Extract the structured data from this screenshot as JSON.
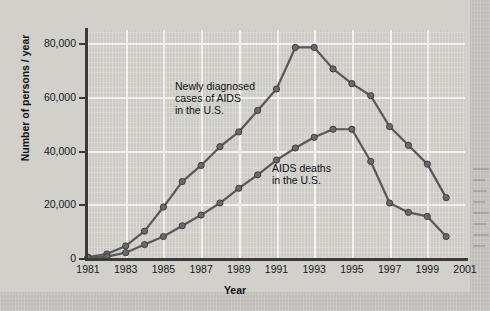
{
  "chart_data": {
    "type": "line",
    "title": "",
    "xlabel": "Year",
    "ylabel": "Number of persons / year",
    "grid": true,
    "legend_position": "inline-annotations",
    "xlim": [
      1981,
      2001
    ],
    "ylim": [
      0,
      85000
    ],
    "x": [
      1981,
      1982,
      1983,
      1984,
      1985,
      1986,
      1987,
      1988,
      1989,
      1990,
      1991,
      1992,
      1993,
      1994,
      1995,
      1996,
      1997,
      1998,
      1999,
      2000
    ],
    "x_tick_labels": [
      "1981",
      "1983",
      "1985",
      "1987",
      "1989",
      "1991",
      "1993",
      "1995",
      "1997",
      "1999",
      "2001"
    ],
    "x_tick_values": [
      1981,
      1983,
      1985,
      1987,
      1989,
      1991,
      1993,
      1995,
      1997,
      1999,
      2001
    ],
    "y_tick_labels": [
      "0",
      "20,000",
      "40,000",
      "60,000",
      "80,000"
    ],
    "y_tick_values": [
      0,
      20000,
      40000,
      60000,
      80000
    ],
    "series": [
      {
        "name": "Newly diagnosed cases of AIDS in the U.S.",
        "annotation": "Newly diagnosed\ncases of AIDS\nin the U.S.",
        "color": "#58585a",
        "values": [
          300,
          1500,
          4500,
          10000,
          19000,
          28500,
          34500,
          41500,
          47000,
          55000,
          63000,
          78500,
          78500,
          70500,
          65000,
          60500,
          49000,
          42000,
          35000,
          22500
        ]
      },
      {
        "name": "AIDS deaths in the U.S.",
        "annotation": "AIDS deaths\nin the U.S.",
        "color": "#58585a",
        "values": [
          200,
          500,
          2000,
          5000,
          8000,
          12000,
          16000,
          20500,
          26000,
          31000,
          36500,
          41000,
          45000,
          48000,
          48000,
          36000,
          20500,
          17000,
          15500,
          8000
        ]
      }
    ]
  }
}
